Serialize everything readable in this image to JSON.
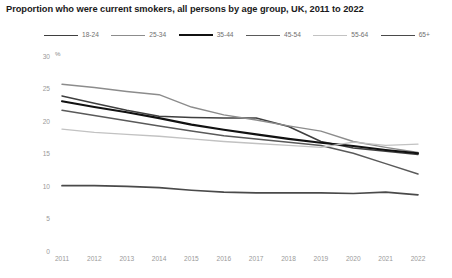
{
  "title": "Proportion who were current smokers, all persons by age group, UK, 2011 to 2022",
  "axis": {
    "unit_label": "%",
    "y_ticks": [
      "30",
      "25",
      "20",
      "15",
      "10",
      "5",
      "0"
    ],
    "x_ticks": [
      "2011",
      "2012",
      "2013",
      "2014",
      "2015",
      "2016",
      "2017",
      "2018",
      "2019",
      "2020",
      "2021",
      "2022"
    ]
  },
  "legend": {
    "items": [
      {
        "label": "18-24",
        "color": "#3f3f3f",
        "width": 1.5
      },
      {
        "label": "25-34",
        "color": "#8c8c8c",
        "width": 1.4
      },
      {
        "label": "35-44",
        "color": "#111111",
        "width": 2.1
      },
      {
        "label": "45-54",
        "color": "#5a5a5a",
        "width": 1.5
      },
      {
        "label": "55-64",
        "color": "#c2c2c2",
        "width": 1.4
      },
      {
        "label": "65+",
        "color": "#4a4a4a",
        "width": 1.7
      }
    ]
  },
  "chart_data": {
    "type": "line",
    "title": "Proportion who were current smokers, all persons by age group, UK, 2011 to 2022",
    "xlabel": "",
    "ylabel": "%",
    "ylim": [
      0,
      30
    ],
    "grid": false,
    "legend_position": "top",
    "x": [
      2011,
      2012,
      2013,
      2014,
      2015,
      2016,
      2017,
      2018,
      2019,
      2020,
      2021,
      2022
    ],
    "series": [
      {
        "name": "18-24",
        "color": "#3f3f3f",
        "width": 1.5,
        "values": [
          24.0,
          22.9,
          21.8,
          20.9,
          20.7,
          20.6,
          20.6,
          19.3,
          17.0,
          16.0,
          15.5,
          15.0
        ]
      },
      {
        "name": "25-34",
        "color": "#8c8c8c",
        "width": 1.4,
        "values": [
          25.8,
          25.3,
          24.7,
          24.2,
          22.3,
          21.1,
          20.3,
          19.4,
          18.6,
          17.0,
          16.1,
          15.3
        ]
      },
      {
        "name": "35-44",
        "color": "#111111",
        "width": 2.1,
        "values": [
          23.2,
          22.3,
          21.5,
          20.6,
          19.6,
          18.8,
          18.1,
          17.4,
          16.8,
          16.3,
          15.7,
          15.2
        ]
      },
      {
        "name": "45-54",
        "color": "#5a5a5a",
        "width": 1.5,
        "values": [
          21.8,
          21.0,
          20.2,
          19.4,
          18.6,
          17.9,
          17.4,
          16.9,
          16.4,
          15.2,
          13.6,
          12.0
        ]
      },
      {
        "name": "55-64",
        "color": "#c2c2c2",
        "width": 1.4,
        "values": [
          18.9,
          18.4,
          18.1,
          17.8,
          17.4,
          17.0,
          16.7,
          16.4,
          16.1,
          16.9,
          16.4,
          16.6
        ]
      },
      {
        "name": "65+",
        "color": "#4a4a4a",
        "width": 1.7,
        "values": [
          10.2,
          10.2,
          10.1,
          9.9,
          9.5,
          9.2,
          9.1,
          9.1,
          9.1,
          9.0,
          9.2,
          8.8
        ]
      }
    ]
  }
}
